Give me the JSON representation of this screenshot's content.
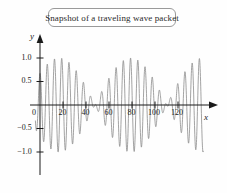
{
  "figure": {
    "title": "Snapshot of a traveling wave packet",
    "x_axis_label": "x",
    "y_axis_label": "y",
    "curve_color": "#8c8c8c",
    "axis_color": "#1a1a1a",
    "title_border_color": "#9a9a9a",
    "background_color": "#fefefe"
  },
  "chart_data": {
    "type": "line",
    "title": "Snapshot of a traveling wave packet",
    "xlabel": "x",
    "ylabel": "y",
    "xlim": [
      -6,
      147
    ],
    "ylim": [
      -1.25,
      1.25
    ],
    "grid": false,
    "legend": null,
    "xticks": [
      0,
      20,
      40,
      60,
      80,
      100,
      120
    ],
    "xtick_labels": [
      "0",
      "20",
      "40",
      "60",
      "80",
      "100",
      "120"
    ],
    "yticks": [
      -1.0,
      -0.5,
      0.5,
      1.0
    ],
    "ytick_labels": [
      "-1.0",
      "-0.5",
      "0.5",
      "1.0"
    ],
    "origin_label": "0",
    "series": [
      {
        "name": "wave packet",
        "description": "Beat pattern: product of carrier and slow envelope, y = cos(2*pi*x/6.3) * cos(2*pi*x/125 - pi*0.265)",
        "carrier_wavelength": 6.3,
        "envelope_wavelength": 125,
        "envelope_phase": -0.265,
        "amplitude": 1.0,
        "x_start": -4,
        "x_end": 142,
        "packet_centers": [
          33,
          93
        ],
        "node_positions": [
          63
        ],
        "peak_amplitude": 1.0
      }
    ]
  }
}
